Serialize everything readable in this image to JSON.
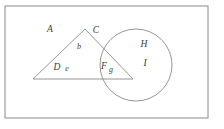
{
  "figure": {
    "type": "region-diagram",
    "background_color": "#ffffff",
    "stroke_color": "#8a8a8a",
    "label_color": "#3a3a3a",
    "border": {
      "x": 5,
      "y": 6,
      "width": 203,
      "height": 112,
      "stroke_width": 1
    },
    "shapes": {
      "triangle": {
        "apex": {
          "x": 85,
          "y": 29
        },
        "left_vertex": {
          "x": 33,
          "y": 79
        },
        "right_vertex": {
          "x": 133,
          "y": 79
        },
        "points": "85,29 33,79 133,79",
        "stroke_width": 0.9
      },
      "circle": {
        "cx": 136,
        "cy": 65,
        "r": 36,
        "stroke_width": 0.9
      }
    },
    "labels": [
      {
        "id": "A",
        "text": "A",
        "x": 50,
        "y": 30,
        "size": "upper"
      },
      {
        "id": "C",
        "text": "C",
        "x": 96,
        "y": 31,
        "size": "upper"
      },
      {
        "id": "b",
        "text": "b",
        "x": 79,
        "y": 47,
        "size": "lower"
      },
      {
        "id": "D",
        "text": "D",
        "x": 57,
        "y": 68,
        "size": "upper"
      },
      {
        "id": "e",
        "text": "e",
        "x": 67,
        "y": 69,
        "size": "lower"
      },
      {
        "id": "F",
        "text": "F",
        "x": 104,
        "y": 67,
        "size": "upper"
      },
      {
        "id": "g",
        "text": "g",
        "x": 111,
        "y": 70,
        "size": "lower"
      },
      {
        "id": "H",
        "text": "H",
        "x": 144,
        "y": 45,
        "size": "upper"
      },
      {
        "id": "I",
        "text": "I",
        "x": 145,
        "y": 64,
        "size": "upper"
      }
    ]
  }
}
